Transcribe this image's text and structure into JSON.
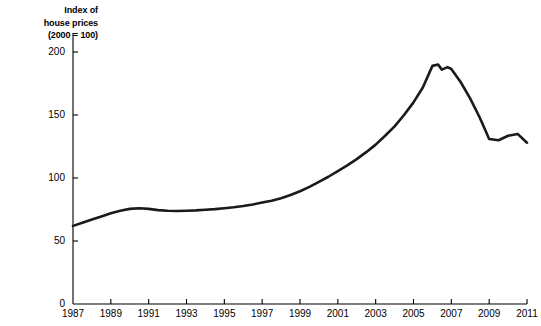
{
  "chart_data": {
    "type": "line",
    "title": "",
    "ylabel": "Index of house prices (2000 = 100)",
    "ylabel_lines": [
      "Index of",
      "house prices",
      "(2000 = 100)"
    ],
    "xlabel": "",
    "xlim": [
      1987,
      2011
    ],
    "ylim": [
      0,
      215
    ],
    "yticks": [
      0,
      50,
      100,
      150,
      200
    ],
    "ytick_labels": [
      "0",
      "50",
      "100",
      "150",
      "200"
    ],
    "xticks": [
      1987,
      1989,
      1991,
      1993,
      1995,
      1997,
      1999,
      2001,
      2003,
      2005,
      2007,
      2009,
      2011
    ],
    "xtick_labels": [
      "1987",
      "1989",
      "1991",
      "1993",
      "1995",
      "1997",
      "1999",
      "2001",
      "2003",
      "2005",
      "2007",
      "2009",
      "2011"
    ],
    "grid": false,
    "legend": false,
    "line_color": "#1a1a1a",
    "series": [
      {
        "name": "Index of house prices",
        "x": [
          1987,
          1987.5,
          1988,
          1988.5,
          1989,
          1989.5,
          1990,
          1990.5,
          1991,
          1991.5,
          1992,
          1992.5,
          1993,
          1993.5,
          1994,
          1994.5,
          1995,
          1995.5,
          1996,
          1996.5,
          1997,
          1997.5,
          1998,
          1998.5,
          1999,
          1999.5,
          2000,
          2000.5,
          2001,
          2001.5,
          2002,
          2002.5,
          2003,
          2003.5,
          2004,
          2004.5,
          2005,
          2005.5,
          2006,
          2006.3,
          2006.5,
          2006.8,
          2007,
          2007.5,
          2008,
          2008.5,
          2009,
          2009.5,
          2010,
          2010.5,
          2011
        ],
        "y": [
          62,
          64.5,
          67,
          69.5,
          72,
          74,
          75.5,
          76,
          75.5,
          74.5,
          74,
          73.8,
          74,
          74.3,
          74.8,
          75.3,
          76,
          76.8,
          77.8,
          79,
          80.5,
          82,
          84,
          86.5,
          89.5,
          93,
          97,
          101,
          105.5,
          110,
          115,
          120.5,
          126.5,
          133.5,
          141,
          150,
          160,
          172,
          189,
          190,
          186,
          188,
          186.5,
          176,
          163,
          148,
          131,
          130,
          133.5,
          135,
          128
        ]
      }
    ],
    "annotations": []
  }
}
